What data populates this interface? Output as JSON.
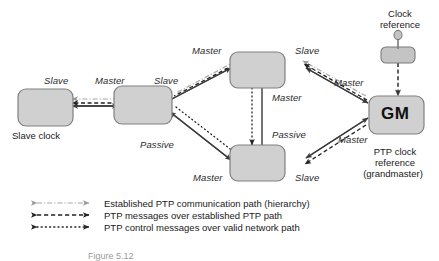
{
  "figure": {
    "type": "ptp-clock-hierarchy-diagram",
    "caption": "Figure 5.12"
  },
  "colors": {
    "node_fill": "#d0d0d0",
    "node_stroke": "#808080",
    "line_solid": "#3a3a3a",
    "line_dashdot": "#a8a8a8",
    "line_dashed": "#222222",
    "line_dotted": "#222222",
    "text": "#1a1a1a"
  },
  "nodes": [
    {
      "id": "slave-clock",
      "label": "",
      "caption": "Slave clock"
    },
    {
      "id": "boundary-clock-1",
      "label": "",
      "caption": ""
    },
    {
      "id": "boundary-clock-top",
      "label": "",
      "caption": ""
    },
    {
      "id": "boundary-clock-bottom",
      "label": "",
      "caption": ""
    },
    {
      "id": "grandmaster",
      "label": "GM",
      "caption": "PTP clock reference (grandmaster)"
    }
  ],
  "clock_reference": {
    "title_line1": "Clock",
    "title_line2": "reference"
  },
  "grandmaster_caption": {
    "line1": "PTP clock",
    "line2": "reference",
    "line3": "(grandmaster)"
  },
  "slave_clock_caption": "Slave clock",
  "port_labels": [
    {
      "id": "slave-left",
      "text": "Slave"
    },
    {
      "id": "master-node1-left",
      "text": "Master"
    },
    {
      "id": "slave-node1-right",
      "text": "Slave"
    },
    {
      "id": "passive-node1-right",
      "text": "Passive"
    },
    {
      "id": "master-top-left",
      "text": "Master"
    },
    {
      "id": "slave-top-right",
      "text": "Slave"
    },
    {
      "id": "master-top-bottom",
      "text": "Master"
    },
    {
      "id": "passive-bottom-top",
      "text": "Passive"
    },
    {
      "id": "master-bottom-left",
      "text": "Master"
    },
    {
      "id": "slave-bottom-right",
      "text": "Slave"
    },
    {
      "id": "master-gm-upper",
      "text": "Master"
    },
    {
      "id": "master-gm-lower",
      "text": "Master"
    }
  ],
  "legend": {
    "items": [
      {
        "style": "dash-dot",
        "text": "Established PTP communication path (hierarchy)"
      },
      {
        "style": "dashed",
        "text": "PTP messages over established PTP path"
      },
      {
        "style": "dotted",
        "text": "PTP control messages over valid network path"
      }
    ]
  }
}
